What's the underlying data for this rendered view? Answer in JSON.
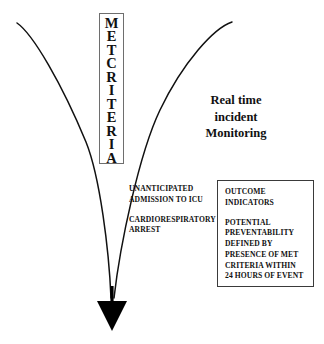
{
  "diagram": {
    "title_box": {
      "name": "MET CRITERIA",
      "line1": "MET",
      "line2": "CRITERIA",
      "border_color": "#6e6e6e"
    },
    "monitoring_label": {
      "line1": "Real time",
      "line2": "incident",
      "line3": "Monitoring"
    },
    "triggers": [
      {
        "lines": [
          "UNANTICIPATED",
          "ADMISSION TO ICU"
        ]
      },
      {
        "lines": [
          "CARDIORESPIRATORY",
          "ARREST"
        ]
      }
    ],
    "outcome_box": {
      "border_color": "#3a3a3a",
      "heading": {
        "lines": [
          "OUTCOME",
          "INDICATORS"
        ]
      },
      "body": {
        "lines": [
          "POTENTIAL",
          "PREVENTABILITY",
          "DEFINED BY",
          "PRESENCE OF MET",
          "CRITERIA WITHIN",
          "24  HOURS OF EVENT"
        ]
      }
    },
    "funnel": {
      "stroke_color": "#111111",
      "arrow_color": "#000000"
    },
    "bottom_artifact": ""
  }
}
